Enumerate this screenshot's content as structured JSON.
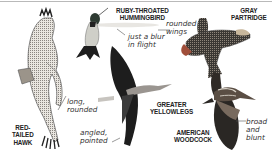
{
  "figure": {
    "topic": "Bird wing shapes",
    "birds": [
      {
        "id": "red-tailed-hawk",
        "name": "RED-\nTAILED\nHAWK",
        "note": "long,\nrounded"
      },
      {
        "id": "ruby-throated-hummingbird",
        "name": "RUBY-THROATED\nHUMMINGBIRD",
        "note": "just a blur\nin flight"
      },
      {
        "id": "gray-partridge",
        "name": "GRAY\nPARTRIDGE",
        "note": "rounded\nwings"
      },
      {
        "id": "greater-yellowlegs",
        "name": "GREATER\nYELLOWLEGS",
        "note": "angled,\npointed"
      },
      {
        "id": "american-woodcock",
        "name": "AMERICAN\nWOODCOCK",
        "note": "broad\nand\nblunt"
      }
    ]
  }
}
